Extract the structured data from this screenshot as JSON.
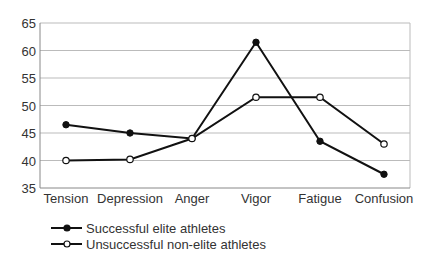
{
  "chart_data": {
    "type": "line",
    "title": "",
    "xlabel": "",
    "ylabel": "",
    "categories": [
      "Tension",
      "Depression",
      "Anger",
      "Vigor",
      "Fatigue",
      "Confusion"
    ],
    "series": [
      {
        "name": "Successful elite athletes",
        "marker": "filled-circle",
        "values": [
          46.5,
          45,
          44,
          61.5,
          43.5,
          37.5
        ]
      },
      {
        "name": "Unsuccessful non-elite athletes",
        "marker": "open-circle",
        "values": [
          40,
          40.2,
          44,
          51.5,
          51.5,
          43
        ]
      }
    ],
    "ylim": [
      35,
      65
    ],
    "yticks": [
      35,
      40,
      45,
      50,
      55,
      60,
      65
    ],
    "grid": true,
    "legend_position": "bottom-left"
  },
  "colors": {
    "line": "#111111",
    "grid": "#bbbbbb",
    "axis": "#888888",
    "text": "#333333"
  }
}
